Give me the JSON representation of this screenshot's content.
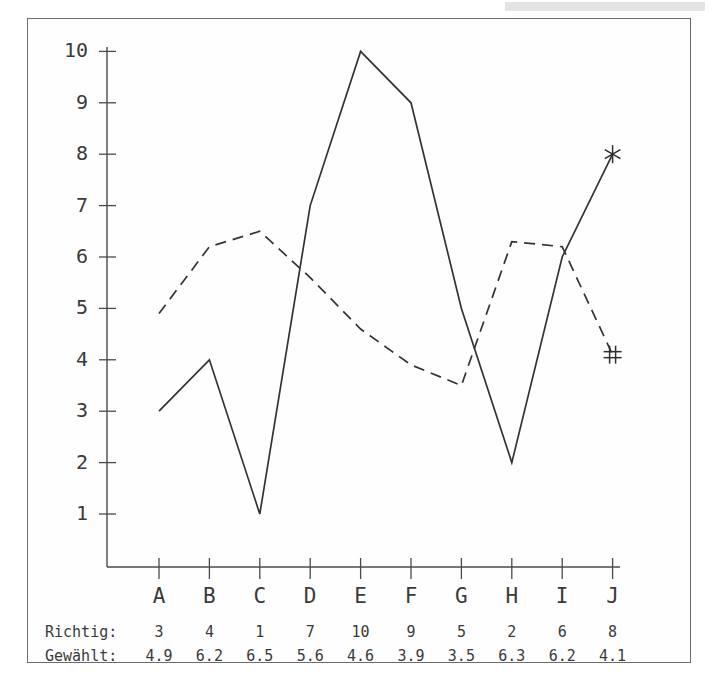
{
  "chart_data": {
    "type": "line",
    "title": "",
    "xlabel": "",
    "ylabel": "",
    "categories": [
      "A",
      "B",
      "C",
      "D",
      "E",
      "F",
      "G",
      "H",
      "I",
      "J"
    ],
    "ylim": [
      0,
      10
    ],
    "yticks": [
      1,
      2,
      3,
      4,
      5,
      6,
      7,
      8,
      9,
      10
    ],
    "grid": false,
    "legend": "none",
    "series": [
      {
        "name": "Richtig",
        "style": "solid",
        "end_marker": "asterisk",
        "color": "#333333",
        "values": [
          3,
          4,
          1,
          7,
          10,
          9,
          5,
          2,
          6,
          8
        ]
      },
      {
        "name": "Gewählt",
        "style": "dashed",
        "end_marker": "hash",
        "color": "#333333",
        "values": [
          4.9,
          6.2,
          6.5,
          5.6,
          4.6,
          3.9,
          3.5,
          6.3,
          6.2,
          4.1
        ]
      }
    ]
  },
  "table": {
    "row_labels": [
      "Richtig:",
      "Gewählt:"
    ],
    "header": [
      "A",
      "B",
      "C",
      "D",
      "E",
      "F",
      "G",
      "H",
      "I",
      "J"
    ],
    "rows": [
      [
        "3",
        "4",
        "1",
        "7",
        "10",
        "9",
        "5",
        "2",
        "6",
        "8"
      ],
      [
        "4.9",
        "6.2",
        "6.5",
        "5.6",
        "4.6",
        "3.9",
        "3.5",
        "6.3",
        "6.2",
        "4.1"
      ]
    ]
  },
  "axis": {
    "y_tick_labels": [
      "10",
      "9",
      "8",
      "7",
      "6",
      "5",
      "4",
      "3",
      "2",
      "1"
    ]
  },
  "markers": {
    "asterisk": "✻",
    "hash": "#"
  }
}
